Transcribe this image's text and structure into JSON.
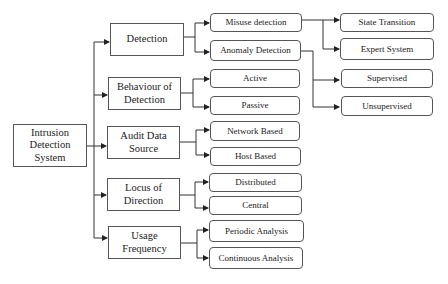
{
  "diagram": {
    "root": {
      "label": "Intrusion\nDetection\nSystem"
    },
    "categories": [
      {
        "label": "Detection",
        "children": [
          "Misuse detection",
          "Anomaly Detection"
        ]
      },
      {
        "label": "Behaviour of\nDetection",
        "children": [
          "Active",
          "Passive"
        ]
      },
      {
        "label": "Audit Data\nSource",
        "children": [
          "Network Based",
          "Host Based"
        ]
      },
      {
        "label": "Locus of\nDirection",
        "children": [
          "Distributed",
          "Central"
        ]
      },
      {
        "label": "Usage\nFrequency",
        "children": [
          "Periodic Analysis",
          "Continuous Analysis"
        ]
      }
    ],
    "subtypes": {
      "misuse_detection": [
        "State Transition",
        "Expert System"
      ],
      "anomaly_detection": [
        "Supervised",
        "Unsupervised"
      ]
    }
  }
}
